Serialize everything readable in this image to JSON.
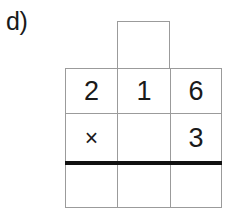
{
  "problem": {
    "label": "d)"
  },
  "carry_row": {
    "value": ""
  },
  "grid": {
    "rows": [
      {
        "name": "multiplicand-row",
        "cells": [
          {
            "value": "2",
            "kind": "digit"
          },
          {
            "value": "1",
            "kind": "digit"
          },
          {
            "value": "6",
            "kind": "digit"
          }
        ]
      },
      {
        "name": "multiplier-row",
        "cells": [
          {
            "value": "×",
            "kind": "operator"
          },
          {
            "value": "",
            "kind": "digit"
          },
          {
            "value": "3",
            "kind": "digit"
          }
        ]
      },
      {
        "name": "answer-row",
        "cells": [
          {
            "value": "",
            "kind": "digit"
          },
          {
            "value": "",
            "kind": "digit"
          },
          {
            "value": "",
            "kind": "digit"
          }
        ]
      }
    ]
  },
  "colors": {
    "grid_line": "#9b9b9b",
    "answer_rule": "#111111",
    "text": "#1a1a1a",
    "background": "#ffffff"
  }
}
